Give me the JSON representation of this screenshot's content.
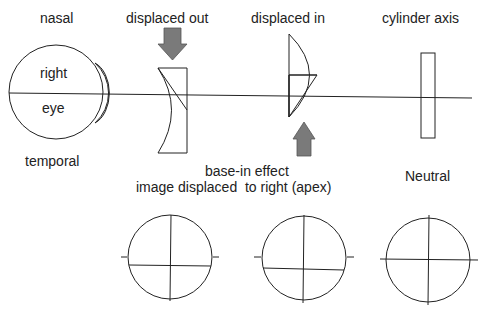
{
  "labels": {
    "nasal": "nasal",
    "temporal": "temporal",
    "eye_top": "right",
    "eye_bottom": "eye",
    "lens1_title": "displaced out",
    "lens2_title": "displaced in",
    "lens3_title": "cylinder axis",
    "caption_line1": "base-in effect",
    "caption_line2": "image displaced  to right (apex)",
    "neutral": "Neutral"
  },
  "colors": {
    "stroke": "#222222",
    "arrow_fill": "#7a7a7a",
    "cornea_fill": "#dcdcdc"
  },
  "reticles": [
    {
      "name": "reticle-displaced-out",
      "horizontal_line_offset": "down"
    },
    {
      "name": "reticle-displaced-in",
      "horizontal_line_offset": "down"
    },
    {
      "name": "reticle-neutral",
      "horizontal_line_offset": "none"
    }
  ]
}
